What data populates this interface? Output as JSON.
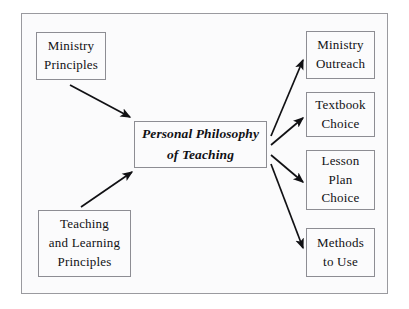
{
  "diagram": {
    "type": "concept-map",
    "title_node": "Personal Philosophy of Teaching",
    "frame": {
      "border_color": "#9a9a9f",
      "background": "#fbfbfc"
    },
    "page_background": "#ffffff",
    "ink_color": "#111114",
    "nodes": {
      "ministry_principles": {
        "label": "Ministry\nPrinciples"
      },
      "teaching_learning_principles": {
        "label": "Teaching\nand Learning\nPrinciples"
      },
      "center": {
        "label": "Personal Philosophy\nof Teaching"
      },
      "ministry_outreach": {
        "label": "Ministry\nOutreach"
      },
      "textbook_choice": {
        "label": "Textbook\nChoice"
      },
      "lesson_plan_choice": {
        "label": "Lesson\nPlan\nChoice"
      },
      "methods_to_use": {
        "label": "Methods\nto Use"
      }
    },
    "edges": [
      {
        "name": "ministry-principles-to-center",
        "from": "ministry_principles",
        "to": "center",
        "direction": "in"
      },
      {
        "name": "teaching-learning-to-center",
        "from": "teaching_learning_principles",
        "to": "center",
        "direction": "in"
      },
      {
        "name": "center-to-ministry-outreach",
        "from": "center",
        "to": "ministry_outreach",
        "direction": "out"
      },
      {
        "name": "center-to-textbook-choice",
        "from": "center",
        "to": "textbook_choice",
        "direction": "out"
      },
      {
        "name": "center-to-lesson-plan-choice",
        "from": "center",
        "to": "lesson_plan_choice",
        "direction": "out"
      },
      {
        "name": "center-to-methods-to-use",
        "from": "center",
        "to": "methods_to_use",
        "direction": "out"
      }
    ]
  }
}
